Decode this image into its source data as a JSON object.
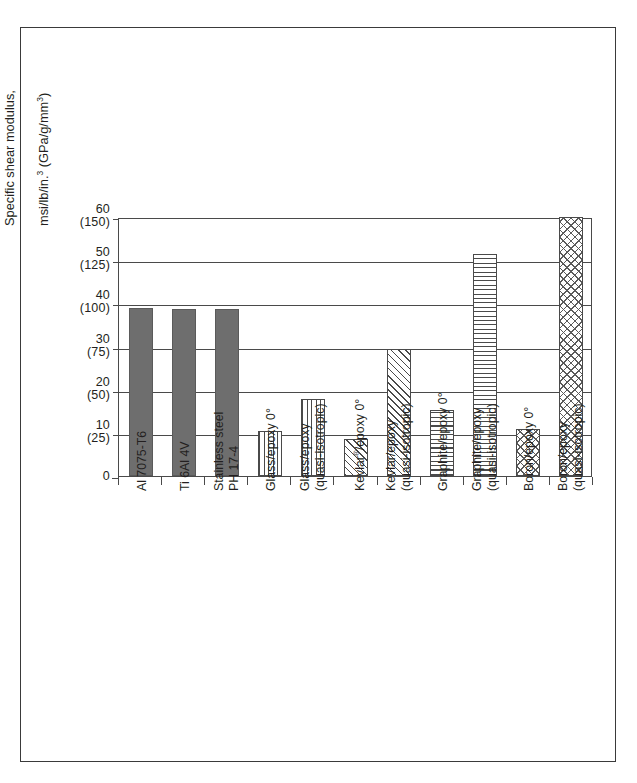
{
  "figure": {
    "frame_border_color": "#3a3a3a"
  },
  "chart_data": {
    "type": "bar",
    "title": "",
    "xlabel": "",
    "ylabel": "Specific shear modulus,\nmsi/lb/in.³ (GPa/g/mm³)",
    "ylabel_line1": "Specific shear modulus,",
    "ylabel_line2_pre": "msi/lb/in.",
    "ylabel_line2_sup1": "3",
    "ylabel_line2_mid": " (GPa/g/mm",
    "ylabel_line2_sup2": "3",
    "ylabel_line2_end": ")",
    "ylim": [
      0,
      60
    ],
    "yticks": [
      0,
      10,
      20,
      30,
      40,
      50,
      60
    ],
    "ytick_labels_primary": [
      "0",
      "10",
      "20",
      "30",
      "40",
      "50",
      "60"
    ],
    "ytick_labels_secondary": [
      "",
      "(25)",
      "(50)",
      "(75)",
      "(100)",
      "(125)",
      "(150)"
    ],
    "grid": true,
    "legend": "none",
    "categories": [
      "Al 7075-T6",
      "Ti 6Al 4V",
      "Stainless steel\nPH 17-4",
      "Glass/epoxy 0°",
      "Glass/epoxy\n(quasi-isotropic)",
      "Kevlar®/epoxy 0°",
      "Kevlar/epoxy\n(quasi-isotropic)",
      "Graphite/epoxy 0°",
      "Graphite/epoxy\n(quasi-isotropic)",
      "Boron/epoxy 0°",
      "Boron/epoxy\n(quasi-isotropic)"
    ],
    "values": [
      39,
      38.8,
      38.8,
      10.5,
      17.8,
      8.5,
      29.5,
      15.2,
      51.5,
      11.0,
      60.0
    ],
    "patterns": [
      "solid-gray",
      "solid-gray",
      "solid-gray",
      "vertical-lines",
      "vertical-lines",
      "diagonal-hatch",
      "diagonal-hatch",
      "horizontal-lines",
      "horizontal-lines",
      "cross-hatch",
      "cross-hatch"
    ]
  },
  "xlabels": [
    {
      "line1": "Al 7075-T6",
      "line2": ""
    },
    {
      "line1": "Ti 6Al 4V",
      "line2": ""
    },
    {
      "line1": "Stainless steel",
      "line2": "PH 17-4"
    },
    {
      "line1": "Glass/epoxy 0°",
      "line2": ""
    },
    {
      "line1": "Glass/epoxy",
      "line2": "(quasi-isotropic)"
    },
    {
      "line1": "Kevlar®/epoxy 0°",
      "line2": ""
    },
    {
      "line1": "Kevlar/epoxy",
      "line2": "(quasi-isotropic)"
    },
    {
      "line1": "Graphite/epoxy 0°",
      "line2": ""
    },
    {
      "line1": "Graphite/epoxy",
      "line2": "(quasi-isotropic)"
    },
    {
      "line1": "Boron/epoxy 0°",
      "line2": ""
    },
    {
      "line1": "Boron/epoxy",
      "line2": "(quasi-isotropic)"
    }
  ]
}
